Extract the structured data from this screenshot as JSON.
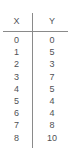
{
  "chart_data": {
    "type": "table",
    "title": "",
    "xlabel": "X",
    "ylabel": "Y",
    "columns": [
      "X",
      "Y"
    ],
    "x": [
      0,
      1,
      2,
      3,
      4,
      5,
      6,
      7,
      8
    ],
    "values": [
      0,
      5,
      3,
      7,
      5,
      4,
      4,
      8,
      10
    ],
    "rows": [
      {
        "x": "0",
        "y": "0"
      },
      {
        "x": "1",
        "y": "5"
      },
      {
        "x": "2",
        "y": "3"
      },
      {
        "x": "3",
        "y": "7"
      },
      {
        "x": "4",
        "y": "5"
      },
      {
        "x": "5",
        "y": "4"
      },
      {
        "x": "6",
        "y": "4"
      },
      {
        "x": "7",
        "y": "8"
      },
      {
        "x": "8",
        "y": "10"
      }
    ],
    "grid": false,
    "legend": null
  },
  "table": {
    "header": {
      "x_label": "X",
      "y_label": "Y"
    },
    "text_color": "#4f5155",
    "rule_color": "#8a8a8a",
    "background": "#ffffff"
  }
}
